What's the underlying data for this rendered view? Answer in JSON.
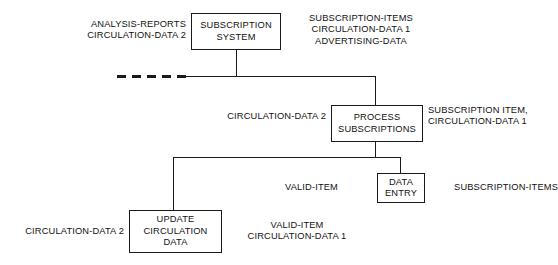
{
  "diagram": {
    "type": "structure-chart",
    "colors": {
      "line": "#1a1a1a",
      "box_border": "#1a1a1a",
      "background": "#ffffff",
      "text": "#111111"
    },
    "nodes": [
      {
        "id": "subscription-system",
        "label": "SUBSCRIPTION\nSYSTEM",
        "inputs": "ANALYSIS-REPORTS\nCIRCULATION-DATA 2",
        "outputs": "SUBSCRIPTION-ITEMS\nCIRCULATION-DATA 1\nADVERTISING-DATA"
      },
      {
        "id": "process-subscriptions",
        "label": "PROCESS\nSUBSCRIPTIONS",
        "inputs": "CIRCULATION-DATA 2",
        "outputs": "SUBSCRIPTION ITEM,\nCIRCULATION-DATA 1"
      },
      {
        "id": "data-entry",
        "label": "DATA\nENTRY",
        "inputs": "VALID-ITEM",
        "outputs": "SUBSCRIPTION-ITEMS"
      },
      {
        "id": "update-circulation-data",
        "label": "UPDATE\nCIRCULATION\nDATA",
        "inputs": "CIRCULATION-DATA 2",
        "outputs": "VALID-ITEM\nCIRCULATION-DATA 1"
      }
    ],
    "edges": [
      {
        "from": "subscription-system",
        "to": "process-subscriptions",
        "style": "solid"
      },
      {
        "from": "subscription-system",
        "to": "dashed-stub",
        "style": "dashed"
      },
      {
        "from": "process-subscriptions",
        "to": "update-circulation-data",
        "style": "solid"
      },
      {
        "from": "process-subscriptions",
        "to": "data-entry",
        "style": "solid"
      }
    ]
  }
}
